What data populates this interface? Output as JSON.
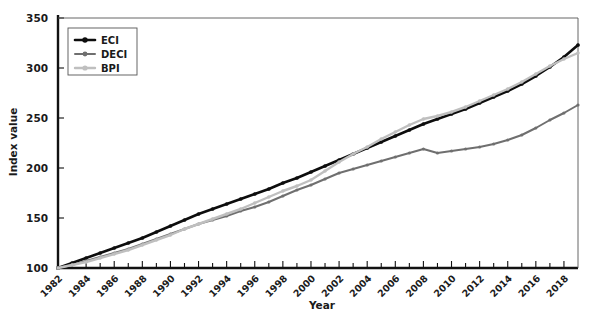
{
  "chart_data": {
    "type": "line",
    "title": "",
    "xlabel": "Year",
    "ylabel": "Index value",
    "xlim": [
      1982,
      2019
    ],
    "ylim": [
      100,
      350
    ],
    "ytick_step": 50,
    "yticks": [
      100,
      150,
      200,
      250,
      300,
      350
    ],
    "xticks_labeled": [
      1982,
      1984,
      1986,
      1988,
      1990,
      1992,
      1994,
      1996,
      1998,
      2000,
      2002,
      2004,
      2006,
      2008,
      2010,
      2012,
      2014,
      2016,
      2018
    ],
    "xtick_label_rotation": 45,
    "grid": false,
    "legend_position": "top-left",
    "marker": "diamond",
    "x": [
      1982,
      1983,
      1984,
      1985,
      1986,
      1987,
      1988,
      1989,
      1990,
      1991,
      1992,
      1993,
      1994,
      1995,
      1996,
      1997,
      1998,
      1999,
      2000,
      2001,
      2002,
      2003,
      2004,
      2005,
      2006,
      2007,
      2008,
      2009,
      2010,
      2011,
      2012,
      2013,
      2014,
      2015,
      2016,
      2017,
      2018,
      2019
    ],
    "series": [
      {
        "name": "ECI",
        "color": "#0d0d0d",
        "width": 2.6,
        "values": [
          100,
          105,
          110,
          115,
          120,
          125,
          130,
          136,
          142,
          148,
          154,
          159,
          164,
          169,
          174,
          179,
          185,
          190,
          196,
          202,
          208,
          214,
          220,
          226,
          232,
          238,
          244,
          249,
          254,
          259,
          265,
          271,
          277,
          284,
          292,
          301,
          311,
          323
        ]
      },
      {
        "name": "DECI",
        "color": "#6f6f6f",
        "width": 2.0,
        "values": [
          100,
          103,
          107,
          111,
          115,
          119,
          124,
          129,
          134,
          139,
          144,
          148,
          152,
          157,
          161,
          166,
          172,
          178,
          183,
          189,
          195,
          199,
          203,
          207,
          211,
          215,
          219,
          215,
          217,
          219,
          221,
          224,
          228,
          233,
          240,
          248,
          255,
          263
        ]
      },
      {
        "name": "BPI",
        "color": "#bfbfbf",
        "width": 2.4,
        "values": [
          100,
          103,
          106,
          110,
          114,
          118,
          123,
          128,
          133,
          139,
          144,
          149,
          154,
          159,
          165,
          171,
          177,
          182,
          188,
          197,
          206,
          214,
          221,
          229,
          236,
          243,
          249,
          252,
          256,
          261,
          267,
          273,
          279,
          286,
          294,
          302,
          309,
          315
        ]
      }
    ]
  },
  "legend": {
    "entries": [
      {
        "label": "ECI"
      },
      {
        "label": "DECI"
      },
      {
        "label": "BPI"
      }
    ]
  }
}
